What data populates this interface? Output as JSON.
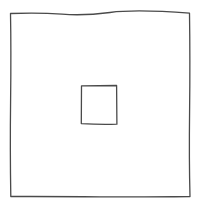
{
  "diagram": {
    "canvas": {
      "width": 200,
      "height": 199,
      "background": "#ffffff"
    },
    "stroke_color": "#4a4a4a",
    "shapes": [
      {
        "name": "outer-square",
        "x": 10,
        "y": 13,
        "width": 180,
        "height": 184
      },
      {
        "name": "inner-square",
        "x": 81,
        "y": 85,
        "width": 36,
        "height": 39
      }
    ]
  }
}
